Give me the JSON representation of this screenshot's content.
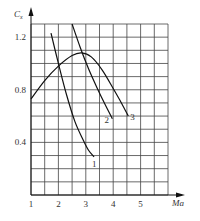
{
  "chart_data": {
    "type": "line",
    "title": "",
    "xlabel": "Ma",
    "ylabel": "Cx",
    "ylabel_main": "C",
    "ylabel_sub": "x",
    "xlim": [
      1,
      6
    ],
    "ylim": [
      0,
      1.3
    ],
    "x_ticks": [
      1,
      2,
      3,
      4,
      5
    ],
    "y_ticks": [
      0.4,
      0.8,
      1.2
    ],
    "grid": true,
    "grid_x_step": 0.5,
    "grid_y_step": 0.1,
    "legend": "none (curves labeled inline 1, 2, 3)",
    "series": [
      {
        "name": "1",
        "label": "1",
        "points": [
          [
            1.73,
            1.23
          ],
          [
            2.0,
            1.0
          ],
          [
            2.3,
            0.76
          ],
          [
            2.6,
            0.56
          ],
          [
            2.9,
            0.42
          ],
          [
            3.1,
            0.34
          ],
          [
            3.3,
            0.29
          ]
        ]
      },
      {
        "name": "2",
        "label": "2",
        "points": [
          [
            2.5,
            1.3
          ],
          [
            2.8,
            1.12
          ],
          [
            3.1,
            0.96
          ],
          [
            3.4,
            0.82
          ],
          [
            3.7,
            0.69
          ],
          [
            3.97,
            0.58
          ]
        ]
      },
      {
        "name": "3",
        "label": "3",
        "points": [
          [
            1.0,
            0.73
          ],
          [
            1.5,
            0.87
          ],
          [
            2.0,
            0.98
          ],
          [
            2.5,
            1.06
          ],
          [
            2.85,
            1.08
          ],
          [
            3.2,
            1.05
          ],
          [
            3.6,
            0.95
          ],
          [
            4.0,
            0.81
          ],
          [
            4.3,
            0.7
          ],
          [
            4.55,
            0.6
          ]
        ]
      }
    ]
  }
}
